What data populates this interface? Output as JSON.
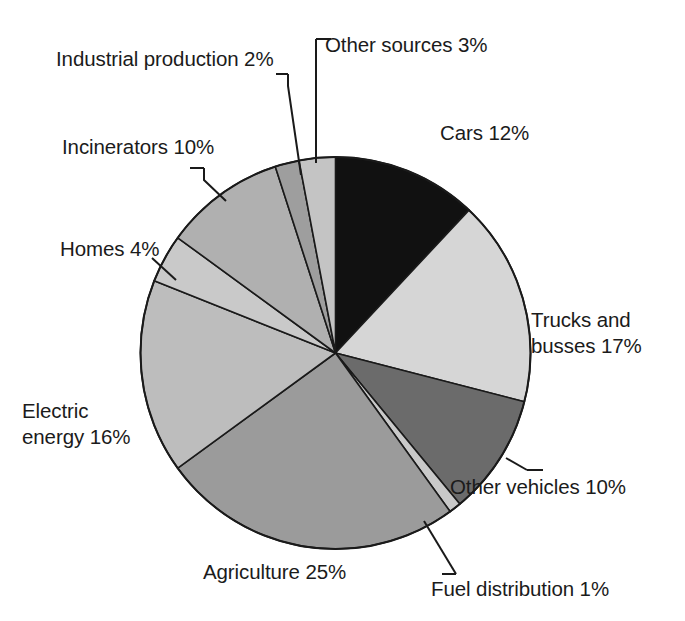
{
  "chart_data": {
    "type": "pie",
    "title": "",
    "subtitle": "",
    "xlabel": "",
    "ylabel": "",
    "legend_position": "callout-labels",
    "grid": false,
    "units": "percent",
    "total": 100,
    "start_angle_deg": 0,
    "direction": "clockwise",
    "categories": [
      "Cars",
      "Trucks and busses",
      "Other vehicles",
      "Fuel distribution",
      "Agriculture",
      "Electric energy",
      "Homes",
      "Incinerators",
      "Industrial production",
      "Other sources"
    ],
    "values": [
      12,
      17,
      10,
      1,
      25,
      16,
      4,
      10,
      2,
      3
    ],
    "colors": [
      "#111111",
      "#d6d6d6",
      "#6b6b6b",
      "#c9c9c9",
      "#9b9b9b",
      "#bdbdbd",
      "#c9c9c9",
      "#b0b0b0",
      "#9e9e9e",
      "#c4c4c4"
    ],
    "slice_stroke": "#1a1a1a",
    "slices": [
      {
        "name": "Cars",
        "value": 12,
        "color": "#111111"
      },
      {
        "name": "Trucks and busses",
        "value": 17,
        "color": "#d6d6d6"
      },
      {
        "name": "Other vehicles",
        "value": 10,
        "color": "#6b6b6b"
      },
      {
        "name": "Fuel distribution",
        "value": 1,
        "color": "#c9c9c9"
      },
      {
        "name": "Agriculture",
        "value": 25,
        "color": "#9b9b9b"
      },
      {
        "name": "Electric energy",
        "value": 16,
        "color": "#bdbdbd"
      },
      {
        "name": "Homes",
        "value": 4,
        "color": "#c9c9c9"
      },
      {
        "name": "Incinerators",
        "value": 10,
        "color": "#b0b0b0"
      },
      {
        "name": "Industrial production",
        "value": 2,
        "color": "#9e9e9e"
      },
      {
        "name": "Other sources",
        "value": 3,
        "color": "#c4c4c4"
      }
    ]
  },
  "labels": {
    "cars": "Cars 12%",
    "trucks_line1": "Trucks and",
    "trucks_line2": "busses 17%",
    "other_vehicles": "Other vehicles 10%",
    "fuel_distribution": "Fuel distribution 1%",
    "agriculture": "Agriculture 25%",
    "electric_line1": "Electric",
    "electric_line2": "energy 16%",
    "homes": "Homes 4%",
    "incinerators": "Incinerators 10%",
    "industrial_production": "Industrial production 2%",
    "other_sources": "Other sources 3%"
  }
}
